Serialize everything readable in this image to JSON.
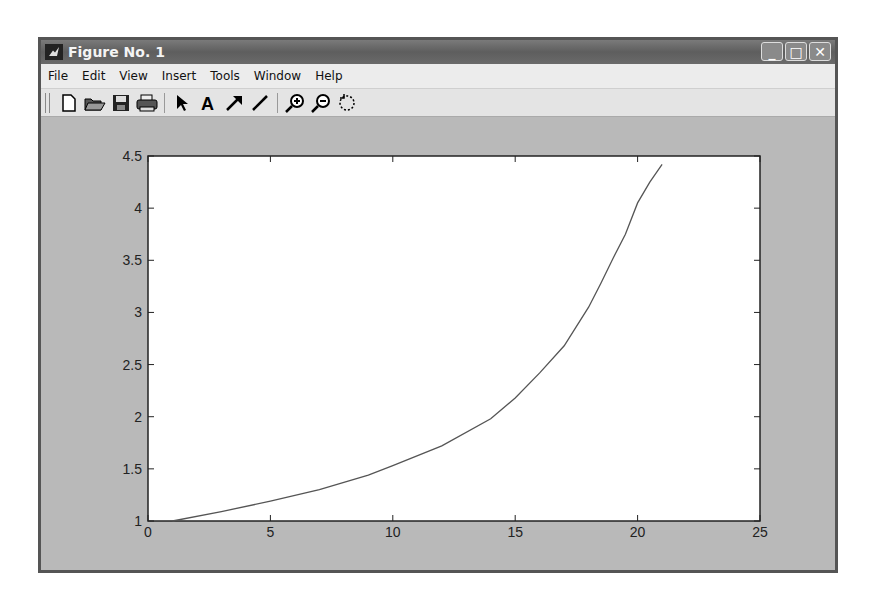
{
  "window": {
    "title": "Figure No. 1",
    "controls": {
      "minimize": "_",
      "maximize": "□",
      "close": "✕"
    }
  },
  "menubar": {
    "items": [
      {
        "label": "File",
        "accel": "F"
      },
      {
        "label": "Edit",
        "accel": "E"
      },
      {
        "label": "View",
        "accel": "V"
      },
      {
        "label": "Insert",
        "accel": "I"
      },
      {
        "label": "Tools",
        "accel": "T"
      },
      {
        "label": "Window",
        "accel": "W"
      },
      {
        "label": "Help",
        "accel": "H"
      }
    ]
  },
  "toolbar": {
    "groups": [
      [
        "new-figure-icon",
        "open-file-icon",
        "save-icon",
        "print-icon"
      ],
      [
        "edit-plot-arrow-icon",
        "insert-text-icon",
        "insert-arrow-icon",
        "insert-line-icon"
      ],
      [
        "zoom-in-icon",
        "zoom-out-icon",
        "rotate-3d-icon"
      ]
    ]
  },
  "colors": {
    "figure_bg": "#b9b9b9",
    "axes_bg": "#ffffff",
    "line": "#555555",
    "titlebar": "#666666"
  },
  "chart_data": {
    "type": "line",
    "title": "",
    "xlabel": "",
    "ylabel": "",
    "xlim": [
      0,
      25
    ],
    "ylim": [
      1,
      4.5
    ],
    "xticks": [
      0,
      5,
      10,
      15,
      20,
      25
    ],
    "yticks": [
      1,
      1.5,
      2,
      2.5,
      3,
      3.5,
      4,
      4.5
    ],
    "xtick_labels": [
      "0",
      "5",
      "10",
      "15",
      "20",
      "25"
    ],
    "ytick_labels": [
      "1",
      "1.5",
      "2",
      "2.5",
      "3",
      "3.5",
      "4",
      "4.5"
    ],
    "grid": false,
    "legend": null,
    "series": [
      {
        "name": "y",
        "x": [
          1,
          3,
          5,
          7,
          9,
          10,
          12,
          14,
          15,
          16,
          17,
          18,
          18.5,
          19,
          19.5,
          20,
          20.5,
          21
        ],
        "y": [
          1.0,
          1.09,
          1.19,
          1.3,
          1.44,
          1.53,
          1.72,
          1.98,
          2.18,
          2.42,
          2.68,
          3.05,
          3.28,
          3.52,
          3.75,
          4.05,
          4.25,
          4.42
        ]
      }
    ]
  }
}
